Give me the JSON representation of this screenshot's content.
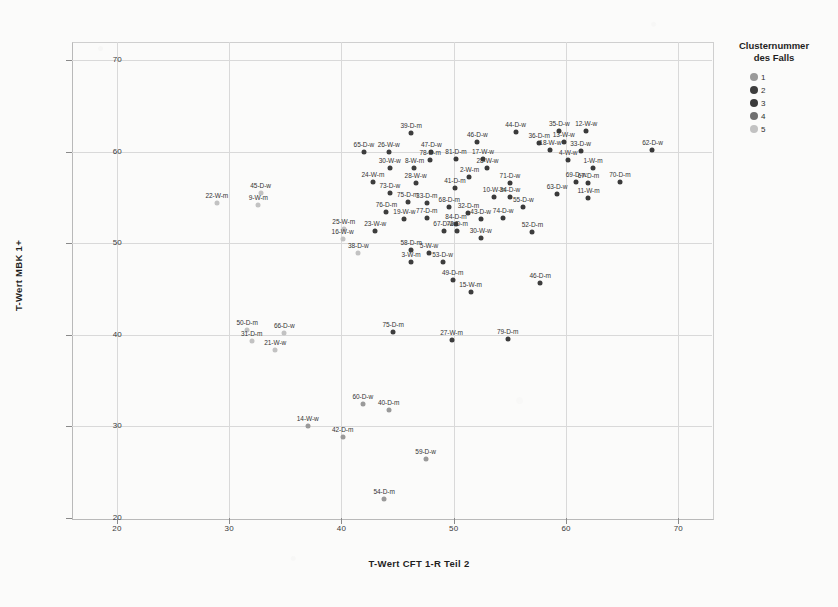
{
  "chart_data": {
    "type": "scatter",
    "title": "",
    "xlabel": "T-Wert CFT 1-R Teil 2",
    "ylabel": "T-Wert MBK 1+",
    "xlim": [
      16,
      73
    ],
    "ylim": [
      20,
      72
    ],
    "xticks": [
      20,
      30,
      40,
      50,
      60,
      70
    ],
    "yticks": [
      20,
      30,
      40,
      50,
      60,
      70
    ],
    "grid": true,
    "legend": {
      "title_line1": "Clusternummer",
      "title_line2": "des Falls",
      "position": "right",
      "entries": [
        {
          "label": "1",
          "color": "#9a9a9a"
        },
        {
          "label": "2",
          "color": "#3d3d3d"
        },
        {
          "label": "3",
          "color": "#3a3a3a"
        },
        {
          "label": "4",
          "color": "#6f6f6f"
        },
        {
          "label": "5",
          "color": "#c2c2c2"
        }
      ]
    },
    "point_label_field": "Fallnummer-Gruppe-Geschlecht",
    "points": [
      {
        "label": "22-W-m",
        "x": 28.9,
        "y": 54.4,
        "cluster": 5
      },
      {
        "label": "45-D-w",
        "x": 32.8,
        "y": 55.5,
        "cluster": 5
      },
      {
        "label": "9-W-m",
        "x": 32.6,
        "y": 54.2,
        "cluster": 5
      },
      {
        "label": "50-D-m",
        "x": 31.6,
        "y": 40.5,
        "cluster": 5
      },
      {
        "label": "66-D-w",
        "x": 34.9,
        "y": 40.2,
        "cluster": 5
      },
      {
        "label": "31-D-m",
        "x": 32.0,
        "y": 39.3,
        "cluster": 5
      },
      {
        "label": "21-W-w",
        "x": 34.1,
        "y": 38.4,
        "cluster": 5
      },
      {
        "label": "25-W-m",
        "x": 40.2,
        "y": 51.6,
        "cluster": 5
      },
      {
        "label": "16-W-w",
        "x": 40.1,
        "y": 50.5,
        "cluster": 5
      },
      {
        "label": "38-D-w",
        "x": 41.5,
        "y": 49.0,
        "cluster": 5
      },
      {
        "label": "14-W-w",
        "x": 37.0,
        "y": 30.0,
        "cluster": 1
      },
      {
        "label": "42-D-m",
        "x": 40.1,
        "y": 28.8,
        "cluster": 1
      },
      {
        "label": "60-D-w",
        "x": 41.9,
        "y": 32.4,
        "cluster": 1
      },
      {
        "label": "40-D-m",
        "x": 44.2,
        "y": 31.8,
        "cluster": 1
      },
      {
        "label": "59-D-w",
        "x": 47.5,
        "y": 26.4,
        "cluster": 1
      },
      {
        "label": "54-D-m",
        "x": 43.8,
        "y": 22.1,
        "cluster": 1
      },
      {
        "label": "65-D-w",
        "x": 42.0,
        "y": 60.0,
        "cluster": 2
      },
      {
        "label": "26-W-w",
        "x": 44.2,
        "y": 60.0,
        "cluster": 2
      },
      {
        "label": "39-D-m",
        "x": 46.2,
        "y": 62.1,
        "cluster": 2
      },
      {
        "label": "47-D-w",
        "x": 48.0,
        "y": 60.0,
        "cluster": 2
      },
      {
        "label": "78-D-m",
        "x": 47.9,
        "y": 59.1,
        "cluster": 2
      },
      {
        "label": "30-W-w",
        "x": 44.3,
        "y": 58.2,
        "cluster": 2
      },
      {
        "label": "8-W-m",
        "x": 46.5,
        "y": 58.2,
        "cluster": 2
      },
      {
        "label": "24-W-m",
        "x": 42.8,
        "y": 56.7,
        "cluster": 2
      },
      {
        "label": "28-W-w",
        "x": 46.6,
        "y": 56.6,
        "cluster": 2
      },
      {
        "label": "73-D-w",
        "x": 44.3,
        "y": 55.5,
        "cluster": 2
      },
      {
        "label": "75-D-m",
        "x": 45.9,
        "y": 54.5,
        "cluster": 2
      },
      {
        "label": "76-D-m",
        "x": 44.0,
        "y": 53.4,
        "cluster": 2
      },
      {
        "label": "19-W-w",
        "x": 45.6,
        "y": 52.7,
        "cluster": 2
      },
      {
        "label": "33-D-m",
        "x": 47.6,
        "y": 54.4,
        "cluster": 2
      },
      {
        "label": "77-D-m",
        "x": 47.6,
        "y": 52.8,
        "cluster": 2
      },
      {
        "label": "81-D-m",
        "x": 50.2,
        "y": 59.2,
        "cluster": 3
      },
      {
        "label": "46-D-w",
        "x": 52.1,
        "y": 61.1,
        "cluster": 3
      },
      {
        "label": "17-W-w",
        "x": 52.6,
        "y": 59.2,
        "cluster": 3
      },
      {
        "label": "28-W-w",
        "x": 53.0,
        "y": 58.2,
        "cluster": 3
      },
      {
        "label": "2-W-m",
        "x": 51.4,
        "y": 57.3,
        "cluster": 3
      },
      {
        "label": "41-D-m",
        "x": 50.1,
        "y": 56.1,
        "cluster": 3
      },
      {
        "label": "10-W-m",
        "x": 53.6,
        "y": 55.1,
        "cluster": 3
      },
      {
        "label": "34-D-w",
        "x": 55.0,
        "y": 55.1,
        "cluster": 3
      },
      {
        "label": "68-D-m",
        "x": 49.6,
        "y": 54.0,
        "cluster": 3
      },
      {
        "label": "32-D-m",
        "x": 51.3,
        "y": 53.3,
        "cluster": 3
      },
      {
        "label": "43-D-w",
        "x": 52.4,
        "y": 52.7,
        "cluster": 3
      },
      {
        "label": "74-D-w",
        "x": 54.4,
        "y": 52.8,
        "cluster": 3
      },
      {
        "label": "84-D-m",
        "x": 50.2,
        "y": 52.1,
        "cluster": 3
      },
      {
        "label": "55-D-w",
        "x": 56.2,
        "y": 54.0,
        "cluster": 3
      },
      {
        "label": "71-D-w",
        "x": 55.0,
        "y": 56.6,
        "cluster": 3
      },
      {
        "label": "36-D-m",
        "x": 57.6,
        "y": 61.0,
        "cluster": 3
      },
      {
        "label": "44-D-w",
        "x": 55.5,
        "y": 62.2,
        "cluster": 3
      },
      {
        "label": "35-D-w",
        "x": 59.4,
        "y": 62.3,
        "cluster": 3
      },
      {
        "label": "12-W-w",
        "x": 61.8,
        "y": 62.3,
        "cluster": 3
      },
      {
        "label": "13-W-w",
        "x": 59.8,
        "y": 61.1,
        "cluster": 3
      },
      {
        "label": "18-W-w",
        "x": 58.6,
        "y": 60.2,
        "cluster": 3
      },
      {
        "label": "4-W-w",
        "x": 60.2,
        "y": 59.1,
        "cluster": 3
      },
      {
        "label": "33-D-w",
        "x": 61.3,
        "y": 60.1,
        "cluster": 3
      },
      {
        "label": "62-D-w",
        "x": 67.7,
        "y": 60.2,
        "cluster": 3
      },
      {
        "label": "1-W-m",
        "x": 62.4,
        "y": 58.2,
        "cluster": 3
      },
      {
        "label": "69-D-w",
        "x": 60.9,
        "y": 56.7,
        "cluster": 3
      },
      {
        "label": "63-D-w",
        "x": 59.2,
        "y": 55.4,
        "cluster": 3
      },
      {
        "label": "67-D-m",
        "x": 62.0,
        "y": 56.6,
        "cluster": 3
      },
      {
        "label": "70-D-m",
        "x": 64.8,
        "y": 56.7,
        "cluster": 3
      },
      {
        "label": "11-W-m",
        "x": 62.0,
        "y": 55.0,
        "cluster": 3
      },
      {
        "label": "23-W-w",
        "x": 43.0,
        "y": 51.3,
        "cluster": 2
      },
      {
        "label": "58-D-m",
        "x": 46.2,
        "y": 49.3,
        "cluster": 2
      },
      {
        "label": "5-W-w",
        "x": 47.8,
        "y": 48.9,
        "cluster": 2
      },
      {
        "label": "3-W-m",
        "x": 46.2,
        "y": 48.0,
        "cluster": 2
      },
      {
        "label": "53-D-w",
        "x": 49.0,
        "y": 48.0,
        "cluster": 2
      },
      {
        "label": "67-D-w",
        "x": 49.1,
        "y": 51.3,
        "cluster": 2
      },
      {
        "label": "72-D-m",
        "x": 50.3,
        "y": 51.3,
        "cluster": 2
      },
      {
        "label": "30-W-w",
        "x": 52.4,
        "y": 50.6,
        "cluster": 2
      },
      {
        "label": "52-D-m",
        "x": 57.0,
        "y": 51.2,
        "cluster": 2
      },
      {
        "label": "46-D-m",
        "x": 57.7,
        "y": 45.7,
        "cluster": 2
      },
      {
        "label": "49-D-m",
        "x": 49.9,
        "y": 46.0,
        "cluster": 2
      },
      {
        "label": "15-W-m",
        "x": 51.5,
        "y": 44.7,
        "cluster": 2
      },
      {
        "label": "75-D-m",
        "x": 44.6,
        "y": 40.3,
        "cluster": 2
      },
      {
        "label": "27-W-m",
        "x": 49.8,
        "y": 39.4,
        "cluster": 2
      },
      {
        "label": "79-D-m",
        "x": 54.8,
        "y": 39.6,
        "cluster": 2
      }
    ]
  }
}
